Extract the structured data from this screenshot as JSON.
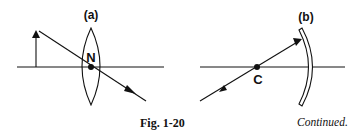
{
  "figure": {
    "caption": "Fig. 1-20",
    "continued_note": "Continued.",
    "panels": [
      {
        "id": "a",
        "label": "(a)",
        "element": "converging lens",
        "point_label": "N",
        "point_meaning": "nodal point (optical center)",
        "object": "upright arrow left of lens",
        "ray": "passes through N undeviated"
      },
      {
        "id": "b",
        "label": "(b)",
        "element": "concave mirror",
        "point_label": "C",
        "point_meaning": "center of curvature",
        "ray": "through C, reflects back on itself"
      }
    ]
  },
  "colors": {
    "ink": "#111111",
    "background": "#ffffff"
  }
}
